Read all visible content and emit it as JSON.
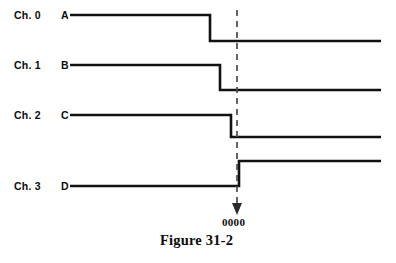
{
  "figure": {
    "caption": "Figure 31-2",
    "marker_label": "0000"
  },
  "channels": [
    {
      "channel": "Ch. 0",
      "signal": "A"
    },
    {
      "channel": "Ch. 1",
      "signal": "B"
    },
    {
      "channel": "Ch. 2",
      "signal": "C"
    },
    {
      "channel": "Ch. 3",
      "signal": "D"
    }
  ],
  "chart_data": {
    "type": "line",
    "title": "Figure 31-2",
    "xlabel": "",
    "ylabel": "",
    "grid": false,
    "legend_position": "left",
    "annotations": [
      {
        "text": "0000",
        "x": 237,
        "kind": "trigger-marker"
      }
    ],
    "x_axis_range": [
      70,
      381
    ],
    "trigger_x": 237,
    "series": [
      {
        "name": "Ch. 0 A",
        "label": "A",
        "channel": "Ch. 0",
        "high_y": 15,
        "low_y": 41,
        "edge_x": 210,
        "edge_type": "falling",
        "start_x": 70,
        "end_x": 381,
        "levels": [
          1,
          0
        ]
      },
      {
        "name": "Ch. 1 B",
        "label": "B",
        "channel": "Ch. 1",
        "high_y": 65,
        "low_y": 90,
        "edge_x": 220,
        "edge_type": "falling",
        "start_x": 70,
        "end_x": 381,
        "levels": [
          1,
          0
        ]
      },
      {
        "name": "Ch. 2 C",
        "label": "C",
        "channel": "Ch. 2",
        "high_y": 115,
        "low_y": 137,
        "edge_x": 231,
        "edge_type": "falling",
        "start_x": 70,
        "end_x": 381,
        "levels": [
          1,
          0
        ]
      },
      {
        "name": "Ch. 3 D",
        "label": "D",
        "channel": "Ch. 3",
        "high_y": 161,
        "low_y": 186,
        "edge_x": 239,
        "edge_type": "rising",
        "start_x": 70,
        "end_x": 381,
        "levels": [
          0,
          1
        ]
      }
    ]
  },
  "geometry": {
    "marker": {
      "x": 237,
      "top_y": 10,
      "bottom_y": 206
    }
  }
}
